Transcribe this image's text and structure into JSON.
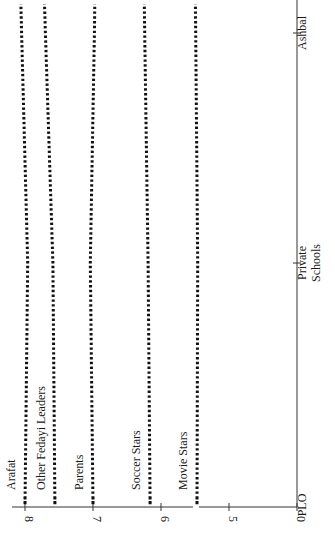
{
  "chart_data": {
    "type": "line",
    "orientation": "rotated-90-ccw",
    "title": "",
    "xlabel": "",
    "ylabel": "",
    "categories": [
      "PLO Schools",
      "Private Schools",
      "Ashbal"
    ],
    "category_lines": [
      [
        "PLO"
      ],
      [
        "Private",
        "Schools"
      ],
      [
        "Ashbal"
      ]
    ],
    "y_ticks": [
      0,
      5,
      6,
      7,
      8
    ],
    "y_axis_break": [
      0,
      5
    ],
    "ylim": [
      0,
      8.2
    ],
    "grid": false,
    "legend": "inline labels",
    "series": [
      {
        "name": "Arafat",
        "values": [
          8.0,
          7.96,
          8.05
        ]
      },
      {
        "name": "Other Fedayi Leaders",
        "values": [
          7.56,
          7.59,
          7.7
        ]
      },
      {
        "name": "Parents",
        "values": [
          7.0,
          7.04,
          6.98
        ]
      },
      {
        "name": "Soccer Stars",
        "values": [
          6.16,
          6.19,
          6.24
        ]
      },
      {
        "name": "Movie Stars",
        "values": [
          5.47,
          5.46,
          5.49
        ]
      }
    ]
  },
  "colors": {
    "line": "#111111",
    "axis": "#333333",
    "background": "#ffffff"
  }
}
